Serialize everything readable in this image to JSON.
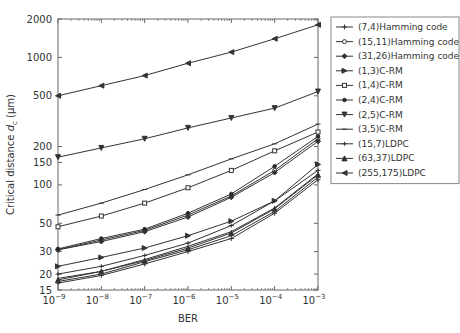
{
  "chart_data": {
    "type": "line",
    "title": "",
    "xlabel": "BER",
    "ylabel": "Critical distance d_c (μm)",
    "ylabel_parts": {
      "pre": "Critical distance ",
      "var": "d",
      "sub": "c",
      "post": " (μm)"
    },
    "xscale": "log",
    "yscale": "log",
    "xlim": [
      1e-09,
      0.001
    ],
    "ylim": [
      15,
      2000
    ],
    "x": [
      1e-09,
      1e-08,
      1e-07,
      1e-06,
      1e-05,
      0.0001,
      0.001
    ],
    "x_tick_labels": [
      {
        "base": "10",
        "exp": "−9"
      },
      {
        "base": "10",
        "exp": "−8"
      },
      {
        "base": "10",
        "exp": "−7"
      },
      {
        "base": "10",
        "exp": "−6"
      },
      {
        "base": "10",
        "exp": "−5"
      },
      {
        "base": "10",
        "exp": "−4"
      },
      {
        "base": "10",
        "exp": "−3"
      }
    ],
    "y_ticks": [
      15,
      20,
      30,
      50,
      100,
      150,
      200,
      500,
      1000,
      2000
    ],
    "y_tick_labels": [
      "15",
      "20",
      "30",
      "50",
      "100",
      "150",
      "200",
      "500",
      "1000",
      "2000"
    ],
    "grid": false,
    "legend_position": "right-outside-top",
    "series": [
      {
        "name": "(7,4)Hamming code",
        "marker": "plus",
        "values": [
          17,
          19.5,
          24,
          30,
          38,
          60,
          110
        ]
      },
      {
        "name": "(15,11)Hamming code",
        "marker": "circle",
        "values": [
          31,
          37,
          44,
          58,
          82,
          130,
          230
        ]
      },
      {
        "name": "(31,26)Hamming code",
        "marker": "diamond",
        "values": [
          31,
          36,
          43,
          56,
          80,
          125,
          220
        ]
      },
      {
        "name": "(1,3)C-RM",
        "marker": "triangle-right",
        "values": [
          23,
          27,
          32,
          40,
          52,
          75,
          145
        ]
      },
      {
        "name": "(1,4)C-RM",
        "marker": "square",
        "values": [
          47,
          57,
          72,
          95,
          130,
          185,
          260
        ]
      },
      {
        "name": "(2,4)C-RM",
        "marker": "star",
        "values": [
          31.5,
          38,
          45,
          60,
          85,
          140,
          240
        ]
      },
      {
        "name": "(2,5)C-RM",
        "marker": "triangle-down",
        "values": [
          165,
          195,
          230,
          280,
          335,
          400,
          540
        ]
      },
      {
        "name": "(3,5)C-RM",
        "marker": "dash",
        "values": [
          58,
          72,
          92,
          120,
          160,
          210,
          300
        ]
      },
      {
        "name": "(15,7)LDPC",
        "marker": "dot-plus",
        "values": [
          20,
          23,
          28,
          35,
          48,
          75,
          130
        ]
      },
      {
        "name": "(63,37)LDPC",
        "marker": "triangle-up",
        "values": [
          18,
          21,
          25.5,
          32,
          42,
          65,
          120
        ]
      },
      {
        "name": "(255,175)LDPC",
        "marker": "triangle-left",
        "values": [
          500,
          600,
          720,
          900,
          1100,
          1400,
          1800
        ]
      },
      {
        "name": "extra-low-1",
        "marker": "none",
        "hidden_in_legend": true,
        "values": [
          18.5,
          21,
          26,
          33,
          43,
          66,
          122
        ]
      },
      {
        "name": "extra-low-2",
        "marker": "none",
        "hidden_in_legend": true,
        "values": [
          17.5,
          20,
          25,
          31,
          40,
          62,
          115
        ]
      }
    ]
  }
}
